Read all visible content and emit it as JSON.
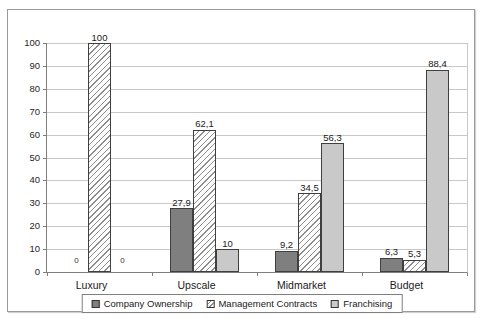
{
  "chart_data": {
    "type": "bar",
    "title": "",
    "xlabel": "",
    "ylabel": "",
    "categories": [
      "Luxury",
      "Upscale",
      "Midmarket",
      "Budget"
    ],
    "series": [
      {
        "name": "Company Ownership",
        "values": [
          0,
          27.9,
          9.2,
          6.3
        ],
        "labels": [
          "0",
          "27,9",
          "9,2",
          "6,3"
        ],
        "color": "#7f7f7f",
        "pattern": "solid"
      },
      {
        "name": "Management Contracts",
        "values": [
          100,
          62.1,
          34.5,
          5.3
        ],
        "labels": [
          "100",
          "62,1",
          "34,5",
          "5,3"
        ],
        "color": "#ffffff",
        "pattern": "diagonal-hatch"
      },
      {
        "name": "Franchising",
        "values": [
          0,
          10,
          56.3,
          88.4
        ],
        "labels": [
          "0",
          "10",
          "56,3",
          "88,4"
        ],
        "color": "#c9c9c9",
        "pattern": "solid"
      }
    ],
    "ylim": [
      0,
      100
    ],
    "ytick_interval": 10,
    "yticks": [
      "100",
      "90",
      "80",
      "70",
      "60",
      "50",
      "40",
      "30",
      "20",
      "10",
      "0"
    ],
    "grid": true,
    "legend_position": "bottom",
    "colors": {
      "gridline": "#c8c8c8",
      "axis": "#7f7f7f",
      "bar_outline": "#3f3f3f",
      "frame_border": "#9a9a9a",
      "text": "#1a1a1a"
    }
  }
}
